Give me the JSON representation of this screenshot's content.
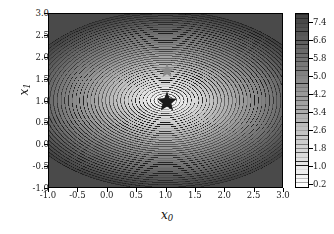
{
  "figure": {
    "type": "contour-plot",
    "background": "#ffffff"
  },
  "axes": {
    "xlabel": "x",
    "xlabel_sub": "0",
    "ylabel": "x",
    "ylabel_sub": "1",
    "xlim": [
      -1.0,
      3.0
    ],
    "ylim": [
      -1.0,
      3.0
    ],
    "xticks": [
      "-1.0",
      "-0.5",
      "0.0",
      "0.5",
      "1.0",
      "1.5",
      "2.0",
      "2.5",
      "3.0"
    ],
    "yticks": [
      "3.0",
      "2.5",
      "2.0",
      "1.5",
      "1.0",
      "0.5",
      "0.0",
      "-0.5",
      "-1.0"
    ],
    "xtick_values": [
      -1.0,
      -0.5,
      0.0,
      0.5,
      1.0,
      1.5,
      2.0,
      2.5,
      3.0
    ],
    "ytick_values": [
      3.0,
      2.5,
      2.0,
      1.5,
      1.0,
      0.5,
      0.0,
      -0.5,
      -1.0
    ]
  },
  "colorbar": {
    "orientation": "vertical",
    "ticks": [
      "7.4",
      "6.6",
      "5.8",
      "5.0",
      "4.2",
      "3.4",
      "2.6",
      "1.8",
      "1.0",
      "0.2"
    ],
    "tick_values": [
      7.4,
      6.6,
      5.8,
      5.0,
      4.2,
      3.4,
      2.6,
      1.8,
      1.0,
      0.2
    ],
    "vmin": 0.0,
    "vmax": 7.8,
    "cmap": "gray_r"
  },
  "markers": [
    {
      "name": "optimum-star",
      "x": 1.0,
      "y": 1.0,
      "color": "#1a1a1a",
      "size": 11,
      "shape": "star"
    },
    {
      "name": "secondary-star",
      "x": 1.0,
      "y": 1.7,
      "color": "#8a8a8a",
      "size": 8,
      "shape": "star"
    }
  ],
  "chart_data": {
    "type": "contour",
    "title": "",
    "xlabel": "x_0",
    "ylabel": "x_1",
    "xlim": [
      -1.0,
      3.0
    ],
    "ylim": [
      -1.0,
      3.0
    ],
    "grid": false,
    "legend": false,
    "colorbar_ticks": [
      0.2,
      1.0,
      1.8,
      2.6,
      3.4,
      4.2,
      5.0,
      5.8,
      6.6,
      7.4
    ],
    "colorbar_range": [
      0.0,
      7.8
    ],
    "n_levels": 40,
    "level_step": 0.195,
    "function": "elliptic_bowl",
    "minimum": {
      "x": 1.0,
      "y": 1.0,
      "value": 0.0
    },
    "field_params": {
      "a": 1.0,
      "b": 1.55,
      "shear": 0.0
    },
    "over_region_color": "#4a4a4a",
    "markers": [
      {
        "label": "minimum",
        "x": 1.0,
        "y": 1.0,
        "color": "#1a1a1a"
      },
      {
        "label": "point",
        "x": 1.0,
        "y": 1.7,
        "color": "#8a8a8a"
      }
    ]
  }
}
